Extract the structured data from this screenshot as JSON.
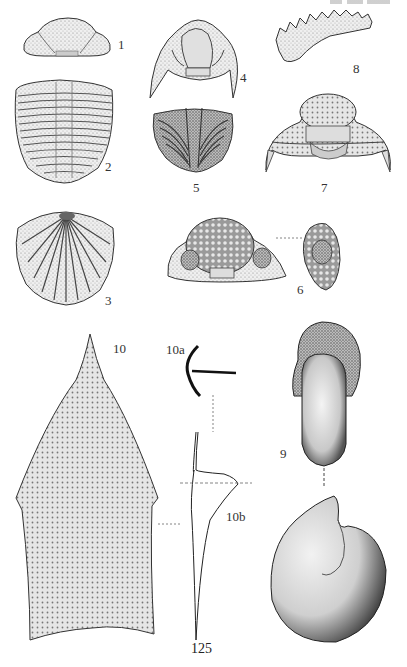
{
  "plate": {
    "page_number": "125",
    "figures": [
      {
        "id": "1",
        "label": "1",
        "subject": "trilobite cephalon"
      },
      {
        "id": "2",
        "label": "2",
        "subject": "trilobite thorax and pygidium"
      },
      {
        "id": "3",
        "label": "3",
        "subject": "ribbed pygidium"
      },
      {
        "id": "4",
        "label": "4",
        "subject": "trilobite cephalon with genal spines"
      },
      {
        "id": "5",
        "label": "5",
        "subject": "trilobite pygidium"
      },
      {
        "id": "6",
        "label": "6",
        "subject": "trilobite cephalon with compound eyes, front and side views"
      },
      {
        "id": "7",
        "label": "7",
        "subject": "trilobite cephalon with genal spines"
      },
      {
        "id": "8",
        "label": "8",
        "subject": "serrated jaw element"
      },
      {
        "id": "9",
        "label": "9",
        "subject": "coiled shell, two views"
      },
      {
        "id": "10",
        "label": "10",
        "subject": "pointed shield plate"
      },
      {
        "id": "10a",
        "label": "10a",
        "subject": "anchor-shaped cross section"
      },
      {
        "id": "10b",
        "label": "10b",
        "subject": "profile outline"
      }
    ]
  },
  "colors": {
    "ink": "#2a2a2a",
    "stipple_light": "#d8d8d8",
    "stipple_mid": "#a8a8a8",
    "stipple_dark": "#555555",
    "background": "#ffffff"
  }
}
